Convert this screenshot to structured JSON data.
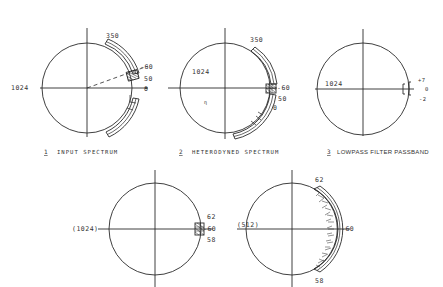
{
  "figure": {
    "panels": [
      {
        "number": "1",
        "caption": "INPUT SPECTRUM",
        "labels": {
          "left": "1024",
          "top_band": "350",
          "marker_high": "-60",
          "marker_mid": "50",
          "marker_low": "0"
        }
      },
      {
        "number": "2",
        "caption": "HETERODYNED SPECTRUM",
        "labels": {
          "left": "1024",
          "top_band": "350",
          "marker_high": "-60",
          "marker_mid": "50",
          "marker_low": "0"
        }
      },
      {
        "number": "3",
        "caption": "LOWPASS FILTER PASSBAND",
        "labels": {
          "left": "1024",
          "upper": "+7",
          "center": "0",
          "lower": "-2"
        }
      },
      {
        "number": "",
        "caption": "",
        "labels": {
          "left": "(1024)",
          "upper": "62",
          "center": "-60",
          "lower": "58"
        }
      },
      {
        "number": "",
        "caption": "",
        "labels": {
          "left": "(512)",
          "upper": "62",
          "center": "-60",
          "lower": "58"
        }
      }
    ]
  }
}
